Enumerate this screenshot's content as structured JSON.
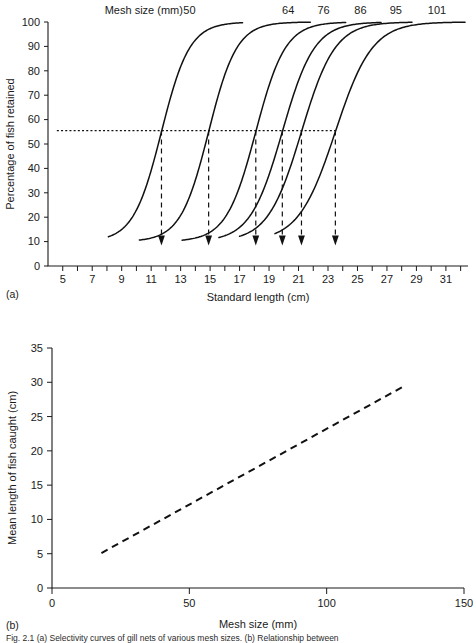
{
  "figure": {
    "panel_a_tag": "(a)",
    "panel_b_tag": "(b)",
    "caption": "Fig. 2.1   (a) Selectivity curves of gill nets of various mesh sizes. (b) Relationship between"
  },
  "chart_data": [
    {
      "id": "panel-a",
      "type": "line",
      "title": "",
      "legend_title": "Mesh size (mm)",
      "legend_position": "top",
      "grid": false,
      "xlabel": "Standard length (cm)",
      "ylabel": "Percentage of fish retained",
      "xlim": [
        4,
        32.5
      ],
      "ylim": [
        0,
        100
      ],
      "xticks": [
        5,
        7,
        9,
        11,
        13,
        15,
        17,
        19,
        21,
        23,
        25,
        27,
        29,
        31
      ],
      "xtick_labels": [
        "5",
        "7",
        "9",
        "11",
        "13",
        "15",
        "17",
        "19",
        "21",
        "23",
        "25",
        "27",
        "29",
        "31"
      ],
      "xtick_minor": [
        6,
        8,
        10,
        12,
        14,
        16,
        18,
        20,
        22,
        24,
        26,
        28,
        30,
        32
      ],
      "yticks": [
        0,
        10,
        20,
        30,
        40,
        50,
        60,
        70,
        80,
        90,
        100
      ],
      "ytick_labels": [
        "0",
        "10",
        "20",
        "30",
        "40",
        "50",
        "60",
        "70",
        "80",
        "90",
        "100"
      ],
      "threshold": {
        "value": 55.5,
        "label": "",
        "style": "dotted",
        "x_start": 4.6,
        "x_end": 23.5
      },
      "series": [
        {
          "name": "50",
          "mesh_size_mm": 50,
          "label": "50",
          "label_x": 13.6,
          "x_start": 8.1,
          "x_end": 17.2,
          "midpoint": 11.7,
          "steepness": 1.05,
          "floor": 10,
          "ceiling": 100,
          "arrow_x": 11.7
        },
        {
          "name": "64",
          "mesh_size_mm": 64,
          "label": "64",
          "label_x": 20.3,
          "x_start": 10.2,
          "x_end": 21.8,
          "midpoint": 14.9,
          "steepness": 1.05,
          "floor": 10,
          "ceiling": 100,
          "arrow_x": 14.9
        },
        {
          "name": "76",
          "mesh_size_mm": 76,
          "label": "76",
          "label_x": 22.7,
          "x_start": 13.1,
          "x_end": 24.2,
          "midpoint": 18.1,
          "steepness": 1.0,
          "floor": 10,
          "ceiling": 100,
          "arrow_x": 18.1
        },
        {
          "name": "86",
          "mesh_size_mm": 86,
          "label": "86",
          "label_x": 25.2,
          "x_start": 15.6,
          "x_end": 26.6,
          "midpoint": 19.9,
          "steepness": 0.92,
          "floor": 10,
          "ceiling": 100,
          "arrow_x": 19.9
        },
        {
          "name": "95",
          "mesh_size_mm": 95,
          "label": "95",
          "label_x": 27.6,
          "x_start": 17.0,
          "x_end": 28.7,
          "midpoint": 21.2,
          "steepness": 0.88,
          "floor": 10,
          "ceiling": 100,
          "arrow_x": 21.2
        },
        {
          "name": "101",
          "mesh_size_mm": 101,
          "label": "101",
          "label_x": 30.4,
          "x_start": 19.4,
          "x_end": 32.3,
          "midpoint": 23.5,
          "steepness": 0.8,
          "floor": 10,
          "ceiling": 100,
          "arrow_x": 23.5
        }
      ]
    },
    {
      "id": "panel-b",
      "type": "line",
      "title": "",
      "grid": false,
      "legend_position": "none",
      "xlabel": "Mesh size (mm)",
      "ylabel": "Mean length of fish caught (cm)",
      "xlim": [
        0,
        150
      ],
      "ylim": [
        0,
        35
      ],
      "xticks": [
        0,
        50,
        100,
        150
      ],
      "xtick_labels": [
        "0",
        "50",
        "100",
        "150"
      ],
      "yticks": [
        0,
        5,
        10,
        15,
        20,
        25,
        30,
        35
      ],
      "ytick_labels": [
        "0",
        "5",
        "10",
        "15",
        "20",
        "25",
        "30",
        "35"
      ],
      "series": [
        {
          "name": "mean-length-vs-mesh",
          "style": "dashed",
          "x": [
            18,
            128
          ],
          "y": [
            5.1,
            29.4
          ]
        }
      ]
    }
  ]
}
